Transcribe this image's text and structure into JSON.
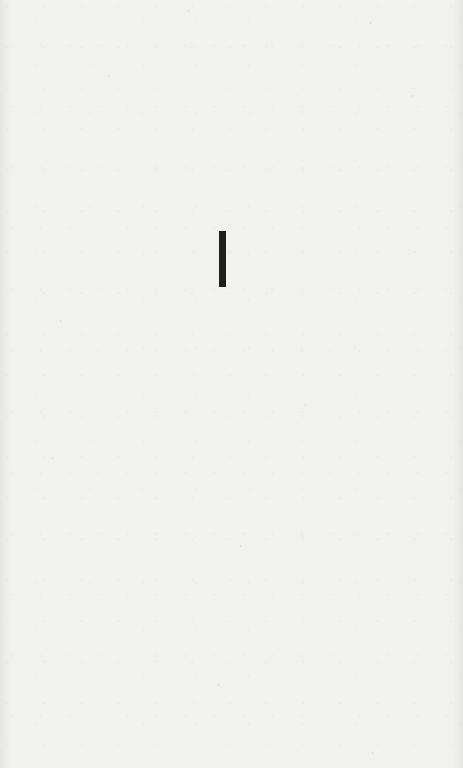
{
  "page": {
    "background_color": "#f1f1f0",
    "title_glyph": "I",
    "glyph_color": "#1f1f1f"
  }
}
